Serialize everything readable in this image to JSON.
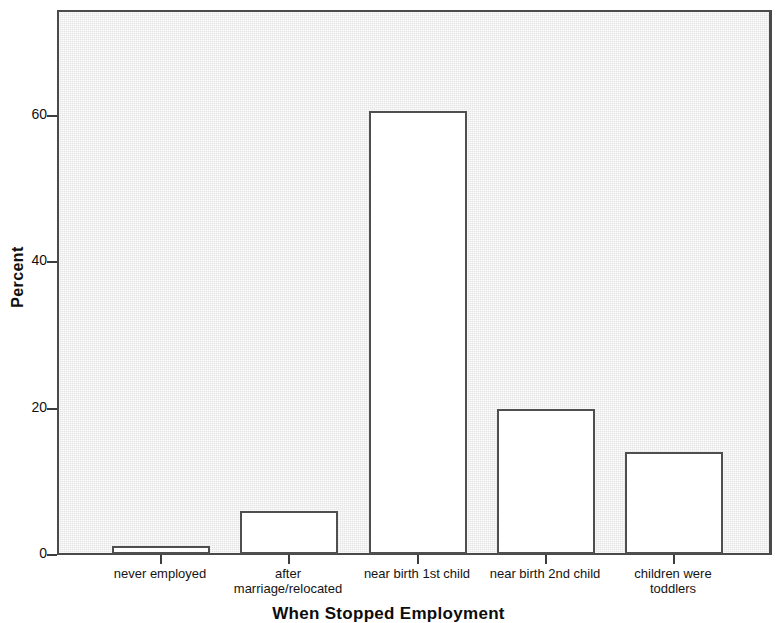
{
  "chart_data": {
    "type": "bar",
    "title": "",
    "xlabel": "When Stopped Employment",
    "ylabel": "Percent",
    "categories": [
      "never employed",
      "after\nmarriage/relocated",
      "near birth 1st child",
      "near birth 2nd child",
      "children were\ntoddlers"
    ],
    "values": [
      1.1,
      5.9,
      60.6,
      19.8,
      13.9
    ],
    "ylim": [
      0,
      74.5
    ],
    "ytick_values": [
      0,
      20,
      40,
      60
    ],
    "ytick_labels": [
      "0",
      "20",
      "40",
      "60"
    ],
    "grid": false,
    "legend": "none",
    "bar_fill_color": "#ffffff",
    "bar_border_color": "#4f4f4f",
    "plot_background_color": "#ebebeb",
    "axis_color": "#3d3d3d"
  },
  "axis": {
    "y_title": "Percent",
    "x_title": "When Stopped Employment"
  },
  "x_labels": [
    {
      "line1": "never employed",
      "line2": ""
    },
    {
      "line1": "after",
      "line2": "marriage/relocated"
    },
    {
      "line1": "near birth 1st child",
      "line2": ""
    },
    {
      "line1": "near birth 2nd child",
      "line2": ""
    },
    {
      "line1": "children were",
      "line2": "toddlers"
    }
  ],
  "y_labels": [
    "0",
    "20",
    "40",
    "60"
  ]
}
